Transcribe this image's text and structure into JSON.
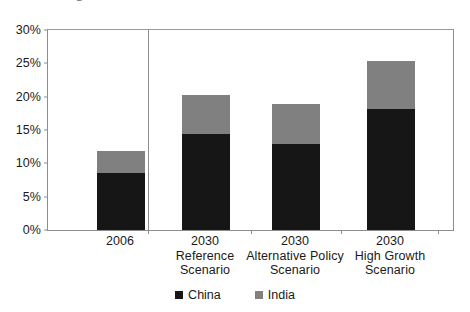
{
  "chart_data": {
    "type": "bar",
    "subtype": "stacked-bar",
    "title": "",
    "xlabel": "",
    "ylabel": "",
    "ylim": [
      0,
      30
    ],
    "yticks": [
      0,
      5,
      10,
      15,
      20,
      25,
      30
    ],
    "ytick_labels": [
      "0%",
      "5%",
      "10%",
      "15%",
      "20%",
      "25%",
      "30%"
    ],
    "grid": false,
    "legend_position": "bottom",
    "units": "percent",
    "categories": [
      "2006",
      "2030 Reference Scenario",
      "2030 Alternative Policy Scenario",
      "2030 High Growth Scenario"
    ],
    "category_lines": [
      [
        "2006"
      ],
      [
        "2030",
        "Reference",
        "Scenario"
      ],
      [
        "2030",
        "Alternative Policy",
        "Scenario"
      ],
      [
        "2030",
        "High Growth",
        "Scenario"
      ]
    ],
    "series": [
      {
        "name": "China",
        "color": "#161616",
        "values": [
          8.6,
          14.4,
          12.9,
          18.2
        ]
      },
      {
        "name": "India",
        "color": "#808080",
        "values": [
          3.3,
          5.9,
          6.0,
          7.1
        ]
      }
    ],
    "totals": [
      11.9,
      20.3,
      18.9,
      25.3
    ],
    "annotations": [
      {
        "type": "vertical-separator",
        "after_category_index": 0
      }
    ]
  },
  "axis": {
    "y_labels": [
      "30%",
      "25%",
      "20%",
      "15%",
      "10%",
      "5%",
      "0%"
    ]
  },
  "legend": {
    "items": [
      {
        "label": "China",
        "color": "#161616"
      },
      {
        "label": "India",
        "color": "#808080"
      }
    ]
  },
  "title_sliver": "g"
}
